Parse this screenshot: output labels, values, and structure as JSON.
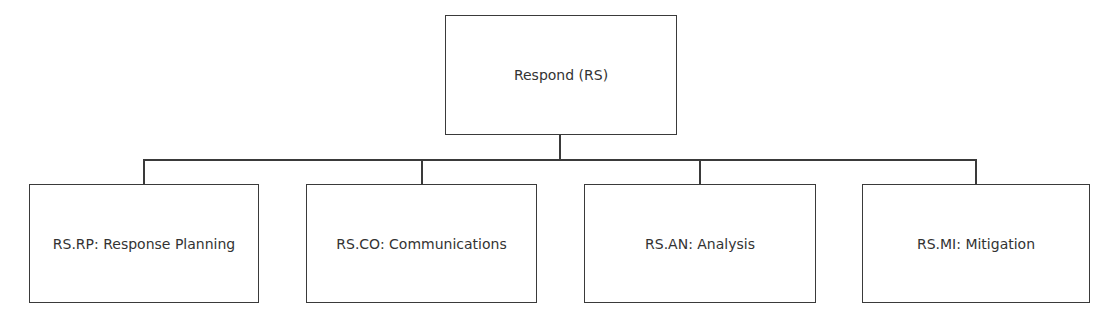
{
  "diagram": {
    "type": "hierarchy",
    "root": {
      "label": "Respond (RS)"
    },
    "children": [
      {
        "label": "RS.RP: Response Planning"
      },
      {
        "label": "RS.CO: Communications"
      },
      {
        "label": "RS.AN: Analysis"
      },
      {
        "label": "RS.MI: Mitigation"
      }
    ],
    "colors": {
      "line": "#3a3a3a",
      "text": "#333333",
      "background": "#ffffff"
    }
  }
}
